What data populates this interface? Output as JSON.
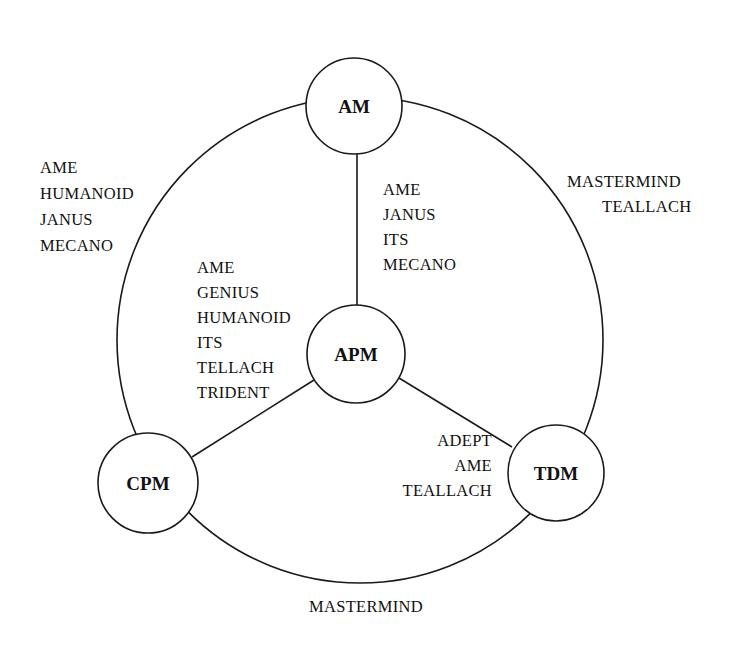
{
  "diagram": {
    "type": "network",
    "colors": {
      "stroke": "#1a1a1a",
      "text": "#111111",
      "background": "#ffffff"
    },
    "outer_ring": {
      "cx": 360,
      "cy": 340,
      "r": 243
    },
    "nodes": [
      {
        "id": "AM",
        "label": "AM",
        "cx": 354,
        "cy": 106,
        "r": 48
      },
      {
        "id": "APM",
        "label": "APM",
        "cx": 356,
        "cy": 354,
        "r": 49
      },
      {
        "id": "CPM",
        "label": "CPM",
        "cx": 148,
        "cy": 483,
        "r": 50
      },
      {
        "id": "TDM",
        "label": "TDM",
        "cx": 556,
        "cy": 473,
        "r": 48
      }
    ],
    "edges": [
      {
        "from": "AM",
        "to": "APM",
        "kind": "spoke",
        "labels": [
          "AME",
          "JANUS",
          "ITS",
          "MECANO"
        ]
      },
      {
        "from": "APM",
        "to": "CPM",
        "kind": "spoke",
        "labels": [
          "AME",
          "GENIUS",
          "HUMANOID",
          "ITS",
          "TELLACH",
          "TRIDENT"
        ]
      },
      {
        "from": "APM",
        "to": "TDM",
        "kind": "spoke",
        "labels": [
          "ADEPT",
          "AME",
          "TEALLACH"
        ]
      },
      {
        "from": "AM",
        "to": "CPM",
        "kind": "arc",
        "labels": [
          "AME",
          "HUMANOID",
          "JANUS",
          "MECANO"
        ]
      },
      {
        "from": "AM",
        "to": "TDM",
        "kind": "arc",
        "labels": [
          "MASTERMIND",
          "TEALLACH"
        ]
      },
      {
        "from": "CPM",
        "to": "TDM",
        "kind": "arc",
        "labels": [
          "MASTERMIND"
        ]
      }
    ]
  }
}
